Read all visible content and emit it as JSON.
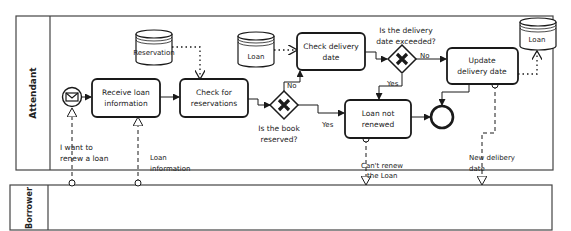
{
  "diagram": {
    "type": "BPMN collaboration",
    "pools": [
      {
        "id": "attendant",
        "label": "Attendant"
      },
      {
        "id": "borrower",
        "label": "Borrower"
      }
    ],
    "events": {
      "start": {
        "label": "",
        "type": "message-start",
        "icon": "envelope-icon"
      },
      "end": {
        "label": "",
        "type": "end"
      }
    },
    "tasks": {
      "receive": {
        "line1": "Receive loan",
        "line2": "information"
      },
      "check_res": {
        "line1": "Check for",
        "line2": "reservations"
      },
      "check_date": {
        "line1": "Check delivery",
        "line2": "date"
      },
      "update": {
        "line1": "Update",
        "line2": "delivery date"
      },
      "not_renewed": {
        "line1": "Loan not",
        "line2": "renewed"
      }
    },
    "data_stores": {
      "reservation": "Reservation",
      "loan1": "Loan",
      "loan2": "Loan"
    },
    "gateways": {
      "reserved": {
        "line1": "Is the book",
        "line2": "reserved?",
        "no": "No",
        "yes": "Yes"
      },
      "exceeded": {
        "line1": "Is the delivery",
        "line2": "date exceeded?",
        "no": "No",
        "yes": "Yes"
      }
    },
    "messages": {
      "want_renew": {
        "line1": "I want to",
        "line2": "renew a loan"
      },
      "loan_info": {
        "line1": "Loan",
        "line2": "information"
      },
      "cant_renew": {
        "line1": "Can't renew",
        "line2": "the Loan"
      },
      "new_date": {
        "line1": "New delibery",
        "line2": "date"
      }
    },
    "colors": {
      "stroke": "#1a1a1a",
      "background": "#ffffff",
      "pool_border": "#444444"
    }
  }
}
